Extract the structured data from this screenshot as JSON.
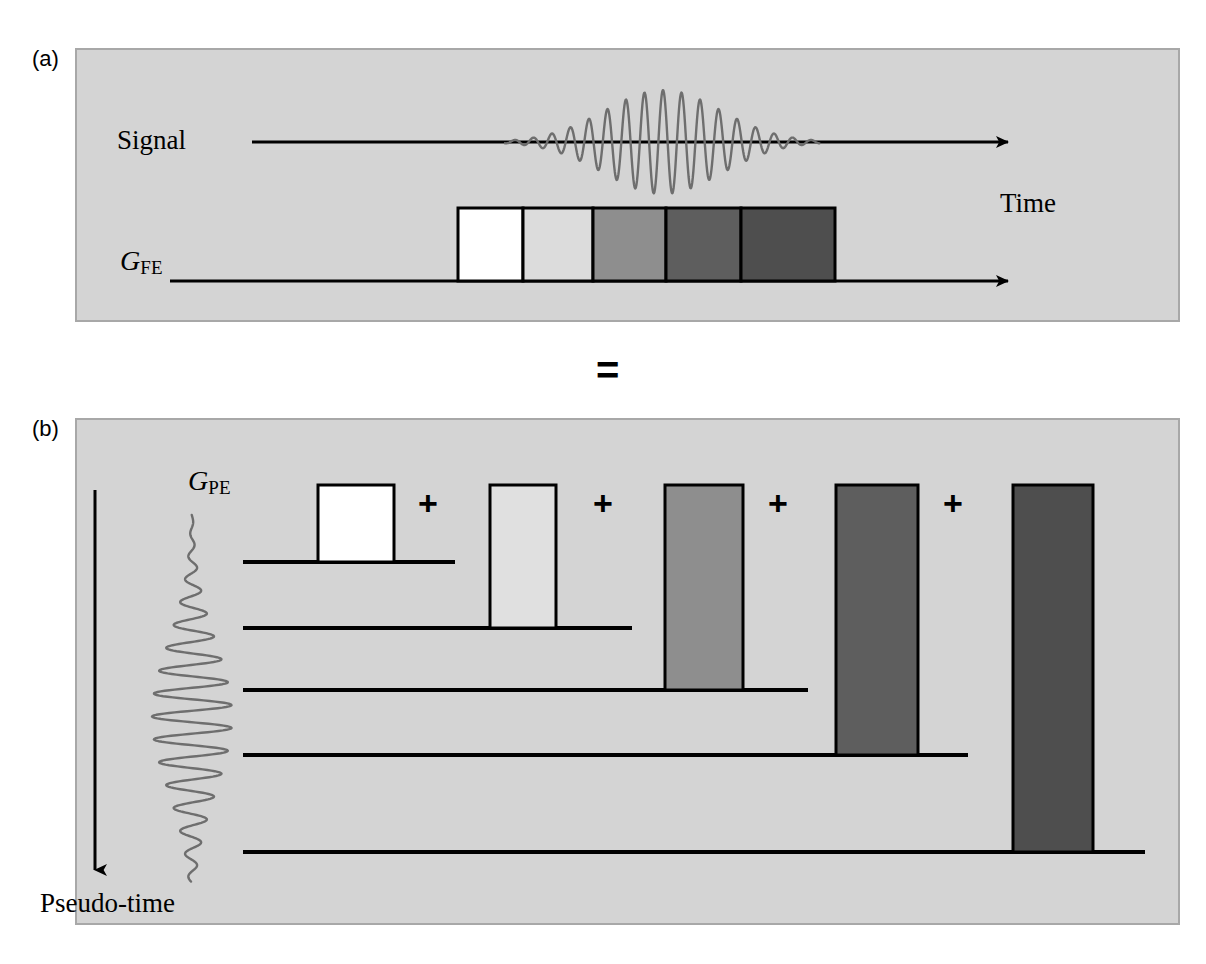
{
  "figure": {
    "type": "diagram",
    "background_color": "#ffffff",
    "panel_fill": "#d4d4d4",
    "panel_border": "#a8a8a8",
    "line_color": "#000000",
    "waveform_color": "#6e6e6e",
    "operator_equals": "=",
    "operator_plus": "+"
  },
  "panels": [
    {
      "id": "a",
      "label": "(a)",
      "rect": {
        "x": 75,
        "y": 48,
        "w": 1105,
        "h": 274
      },
      "axes": [
        {
          "name": "signal-axis",
          "label": "Signal",
          "label_x": 117,
          "label_y": 127,
          "line": {
            "x1": 252,
            "y1": 142,
            "x2": 1010,
            "y2": 142
          },
          "arrow": true
        },
        {
          "name": "gfe-axis",
          "label": "G",
          "sublabel": "FE",
          "label_x": 120,
          "label_y": 247,
          "line": {
            "x1": 170,
            "y1": 281,
            "x2": 1010,
            "y2": 281
          },
          "arrow": true
        }
      ],
      "time_label": "Time",
      "signal_waveform": {
        "name": "gradient-echo-signal",
        "center_x": 663,
        "baseline_y": 142,
        "span_x": [
          505,
          820
        ],
        "max_amplitude": 52,
        "cycles": 17,
        "envelope": "gaussian"
      },
      "gradient_blocks": [
        {
          "index": 0,
          "fill": "#ffffff",
          "x": 458,
          "y": 208,
          "w": 65,
          "h": 73
        },
        {
          "index": 1,
          "fill": "#dcdcdc",
          "x": 523,
          "y": 208,
          "w": 70,
          "h": 73
        },
        {
          "index": 2,
          "fill": "#8e8e8e",
          "x": 593,
          "y": 208,
          "w": 73,
          "h": 73
        },
        {
          "index": 3,
          "fill": "#5e5e5e",
          "x": 666,
          "y": 208,
          "w": 75,
          "h": 73
        },
        {
          "index": 4,
          "fill": "#4e4e4e",
          "x": 741,
          "y": 208,
          "w": 94,
          "h": 73
        }
      ]
    },
    {
      "id": "b",
      "label": "(b)",
      "rect": {
        "x": 75,
        "y": 418,
        "w": 1105,
        "h": 507
      },
      "pseudo_time_axis": {
        "name": "pseudo-time-axis",
        "label": "Pseudo-time",
        "line": {
          "x1": 95,
          "y1": 490,
          "x2": 95,
          "y2": 872
        },
        "arrow": "down"
      },
      "gpe_label": {
        "main": "G",
        "sub": "PE",
        "x": 188,
        "y": 467
      },
      "phase_waveform": {
        "name": "phase-encode-waveform",
        "center_axis_x": 192,
        "span_y": [
          515,
          882
        ],
        "max_amplitude": 40,
        "cycles": 16,
        "envelope": "gaussian"
      },
      "rows": [
        {
          "index": 0,
          "baseline_y": 562,
          "baseline_x1": 243,
          "baseline_x2": 455,
          "block": {
            "fill": "#ffffff",
            "x": 318,
            "y": 485,
            "w": 76,
            "h": 77
          },
          "plus_x": 418,
          "plus_y": 486
        },
        {
          "index": 1,
          "baseline_y": 628,
          "baseline_x1": 243,
          "baseline_x2": 632,
          "block": {
            "fill": "#e0e0e0",
            "x": 490,
            "y": 485,
            "w": 66,
            "h": 143
          },
          "plus_x": 593,
          "plus_y": 486
        },
        {
          "index": 2,
          "baseline_y": 690,
          "baseline_x1": 243,
          "baseline_x2": 808,
          "block": {
            "fill": "#8e8e8e",
            "x": 665,
            "y": 485,
            "w": 78,
            "h": 205
          },
          "plus_x": 768,
          "plus_y": 486
        },
        {
          "index": 3,
          "baseline_y": 755,
          "baseline_x1": 243,
          "baseline_x2": 968,
          "block": {
            "fill": "#5e5e5e",
            "x": 836,
            "y": 485,
            "w": 82,
            "h": 270
          },
          "plus_x": 943,
          "plus_y": 486
        },
        {
          "index": 4,
          "baseline_y": 852,
          "baseline_x1": 243,
          "baseline_x2": 1145,
          "block": {
            "fill": "#4e4e4e",
            "x": 1013,
            "y": 485,
            "w": 80,
            "h": 367
          },
          "plus_x": null,
          "plus_y": null
        }
      ]
    }
  ]
}
